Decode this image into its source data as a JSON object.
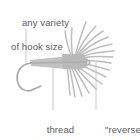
{
  "diagram": {
    "name": "reverse-hackle-fly-tying-diagram",
    "background_color": "#ffffff",
    "ink_color": "#b4b4b4",
    "text_color": "#5b5b5b",
    "width": 140,
    "height": 140
  },
  "labels": {
    "hook_size": {
      "line1": "any variety",
      "line2": "of hook size"
    },
    "thread_body": {
      "line1": "thread",
      "line2": "body"
    },
    "reverse_hackle": {
      "line1": "\"reverse\"",
      "line2": "hackle"
    }
  },
  "leader_lines": [
    {
      "name": "hook-size-leader",
      "x1": 26,
      "y1": 30,
      "x2": 26,
      "y2": 63
    },
    {
      "name": "thread-body-leader",
      "x1": 53,
      "y1": 63,
      "x2": 53,
      "y2": 110
    },
    {
      "name": "reverse-hackle-leader",
      "x1": 96,
      "y1": 62,
      "x2": 96,
      "y2": 110
    }
  ],
  "parts": [
    {
      "name": "hook-shank",
      "description": "horizontal tapered shank"
    },
    {
      "name": "hook-bend",
      "description": "curved C bend with point"
    },
    {
      "name": "thread-body",
      "description": "wrapped thread along shank"
    },
    {
      "name": "reverse-hackle",
      "description": "radiating fan of hackle fibers swept rearward"
    }
  ]
}
